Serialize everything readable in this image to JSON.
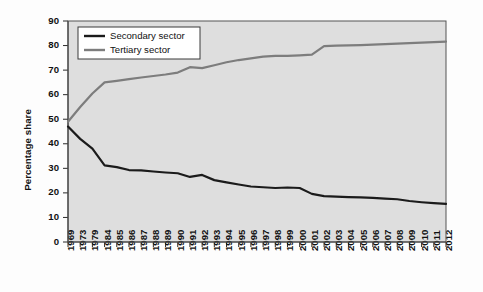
{
  "chart_data": {
    "type": "line",
    "title": "",
    "xlabel": "",
    "ylabel": "Percentage share",
    "ylim": [
      0,
      90
    ],
    "ytick_step": 10,
    "yticks": [
      0,
      10,
      20,
      30,
      40,
      50,
      60,
      70,
      80,
      90
    ],
    "grid": false,
    "legend_position": "top-left",
    "categories": [
      "1969",
      "1973",
      "1979",
      "1984",
      "1985",
      "1986",
      "1987",
      "1988",
      "1989",
      "1990",
      "1991",
      "1992",
      "1993",
      "1994",
      "1995",
      "1996",
      "1997",
      "1998",
      "1999",
      "2000",
      "2001",
      "2002",
      "2003",
      "2004",
      "2005",
      "2006",
      "2007",
      "2008",
      "2009",
      "2010",
      "2011",
      "2012"
    ],
    "series": [
      {
        "name": "Secondary sector",
        "color": "#1b1b1b",
        "values": [
          47.0,
          42.0,
          38.0,
          31.2,
          30.5,
          29.3,
          29.2,
          28.7,
          28.3,
          28.0,
          26.5,
          27.3,
          25.2,
          24.3,
          23.4,
          22.6,
          22.3,
          22.0,
          22.2,
          22.0,
          19.6,
          18.7,
          18.5,
          18.3,
          18.2,
          18.0,
          17.7,
          17.4,
          16.7,
          16.2,
          15.8,
          15.5
        ]
      },
      {
        "name": "Tertiary sector",
        "color": "#7d7d7d",
        "values": [
          49.0,
          55.0,
          60.5,
          65.0,
          65.6,
          66.3,
          67.0,
          67.6,
          68.2,
          69.0,
          71.2,
          70.8,
          72.0,
          73.2,
          74.1,
          74.8,
          75.5,
          75.8,
          75.8,
          76.0,
          76.3,
          79.8,
          80.0,
          80.1,
          80.2,
          80.4,
          80.6,
          80.8,
          81.0,
          81.2,
          81.4,
          81.6
        ]
      }
    ]
  },
  "legend": {
    "items": [
      {
        "label": "Secondary sector",
        "swatch": "line-swatch-dark"
      },
      {
        "label": "Tertiary sector",
        "swatch": "line-swatch-gray"
      }
    ]
  }
}
